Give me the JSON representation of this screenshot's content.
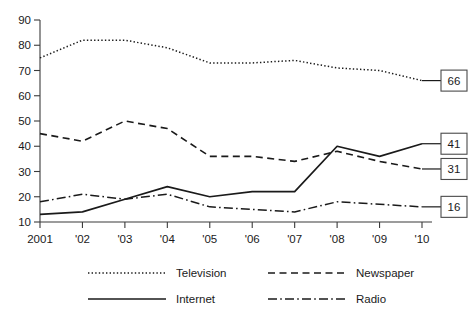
{
  "chart_data": {
    "type": "line",
    "title": "",
    "xlabel": "",
    "ylabel": "",
    "x": [
      "2001",
      "'02",
      "'03",
      "'04",
      "'05",
      "'06",
      "'07",
      "'08",
      "'09",
      "'10"
    ],
    "categories": [
      "2001",
      "'02",
      "'03",
      "'04",
      "'05",
      "'06",
      "'07",
      "'08",
      "'09",
      "'10"
    ],
    "ylim": [
      10,
      90
    ],
    "yticks": [
      10,
      20,
      30,
      40,
      50,
      60,
      70,
      80,
      90
    ],
    "ytick_labels": [
      "10",
      "20",
      "30",
      "40",
      "50",
      "60",
      "70",
      "80",
      "90"
    ],
    "grid": false,
    "legend_position": "below-plot",
    "series": [
      {
        "name": "Television",
        "style": "dotted",
        "values": [
          75,
          82,
          82,
          79,
          73,
          73,
          74,
          71,
          70,
          66
        ],
        "end_label": "66"
      },
      {
        "name": "Newspaper",
        "style": "dashed",
        "values": [
          45,
          42,
          50,
          47,
          36,
          36,
          34,
          38,
          34,
          31
        ],
        "end_label": "31"
      },
      {
        "name": "Internet",
        "style": "solid",
        "values": [
          13,
          14,
          19,
          24,
          20,
          22,
          22,
          40,
          36,
          41
        ],
        "end_label": "41"
      },
      {
        "name": "Radio",
        "style": "dashdot",
        "values": [
          18,
          21,
          19,
          21,
          16,
          15,
          14,
          18,
          17,
          16
        ],
        "end_label": "16"
      }
    ],
    "annotations": [
      {
        "label": "66",
        "series": "Television"
      },
      {
        "label": "41",
        "series": "Internet"
      },
      {
        "label": "31",
        "series": "Newspaper"
      },
      {
        "label": "16",
        "series": "Radio"
      }
    ]
  },
  "legend": {
    "entries": [
      {
        "label": "Television",
        "style": "dotted"
      },
      {
        "label": "Newspaper",
        "style": "dashed"
      },
      {
        "label": "Internet",
        "style": "solid"
      },
      {
        "label": "Radio",
        "style": "dashdot"
      }
    ]
  },
  "colors": {
    "line": "#1a1a1a",
    "axis": "#3b3b3b",
    "background": "#ffffff",
    "callout_border": "#4a4a4a"
  }
}
